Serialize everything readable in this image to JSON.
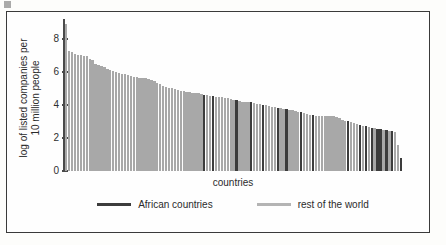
{
  "chart_data": {
    "type": "bar",
    "title": "",
    "xlabel": "countries",
    "ylabel": "log of listed companies per 10 million people",
    "ylabel_lines": [
      "log of listed companies per",
      "10 million people"
    ],
    "ylim": [
      0,
      9.2
    ],
    "yticks": [
      0,
      2,
      4,
      6,
      8
    ],
    "ytick_labels": [
      "0",
      "2",
      "4",
      "6",
      "8"
    ],
    "grid": false,
    "legend_position": "bottom-center",
    "legend": [
      {
        "label": "African countries",
        "color": "#3c3c3c",
        "key": "african"
      },
      {
        "label": "rest of the world",
        "color": "#b4b4b4",
        "key": "rest"
      }
    ],
    "categories_note": "countries sorted in descending order; individual country names are not shown on the axis",
    "series": [
      {
        "name": "log of listed companies per 10 million people",
        "values": [
          8.9,
          7.25,
          7.2,
          7.1,
          7.05,
          7.0,
          6.95,
          6.95,
          6.75,
          6.7,
          6.45,
          6.4,
          6.35,
          6.3,
          6.15,
          6.1,
          6.05,
          6.0,
          5.95,
          5.9,
          5.85,
          5.8,
          5.75,
          5.7,
          5.7,
          5.65,
          5.6,
          5.6,
          5.55,
          5.5,
          5.45,
          5.3,
          5.25,
          5.15,
          5.1,
          5.05,
          5.0,
          4.95,
          4.9,
          4.85,
          4.85,
          4.8,
          4.8,
          4.75,
          4.7,
          4.7,
          4.65,
          4.6,
          4.6,
          4.55,
          4.55,
          4.5,
          4.5,
          4.45,
          4.4,
          4.4,
          4.35,
          4.3,
          4.3,
          4.25,
          4.2,
          4.2,
          4.15,
          4.15,
          4.1,
          4.05,
          4.05,
          4.0,
          4.0,
          3.95,
          3.9,
          3.85,
          3.8,
          3.8,
          3.75,
          3.75,
          3.7,
          3.7,
          3.65,
          3.6,
          3.55,
          3.5,
          3.45,
          3.4,
          3.4,
          3.35,
          3.35,
          3.35,
          3.35,
          3.35,
          3.3,
          3.3,
          3.25,
          3.2,
          3.1,
          3.05,
          3.0,
          2.95,
          2.9,
          2.85,
          2.8,
          2.75,
          2.7,
          2.65,
          2.6,
          2.6,
          2.55,
          2.55,
          2.5,
          2.5,
          2.45,
          2.4,
          2.35,
          1.6,
          0.8
        ],
        "groups": [
          "rest",
          "rest",
          "rest",
          "rest",
          "rest",
          "rest",
          "rest",
          "rest",
          "rest",
          "rest",
          "rest",
          "rest",
          "rest",
          "rest",
          "rest",
          "rest",
          "rest",
          "rest",
          "rest",
          "rest",
          "rest",
          "rest",
          "rest",
          "rest",
          "rest",
          "rest",
          "rest",
          "rest",
          "rest",
          "rest",
          "rest",
          "rest",
          "rest",
          "rest",
          "rest",
          "rest",
          "rest",
          "rest",
          "rest",
          "rest",
          "rest",
          "rest",
          "rest",
          "rest",
          "rest",
          "rest",
          "rest",
          "african",
          "rest",
          "rest",
          "african",
          "rest",
          "rest",
          "rest",
          "rest",
          "rest",
          "rest",
          "rest",
          "african",
          "rest",
          "rest",
          "rest",
          "rest",
          "african",
          "rest",
          "rest",
          "rest",
          "african",
          "rest",
          "rest",
          "rest",
          "rest",
          "african",
          "rest",
          "rest",
          "african",
          "rest",
          "rest",
          "rest",
          "rest",
          "african",
          "rest",
          "rest",
          "rest",
          "african",
          "rest",
          "rest",
          "rest",
          "rest",
          "rest",
          "rest",
          "rest",
          "rest",
          "rest",
          "rest",
          "rest",
          "african",
          "rest",
          "rest",
          "rest",
          "african",
          "rest",
          "african",
          "rest",
          "african",
          "rest",
          "african",
          "african",
          "rest",
          "african",
          "rest",
          "african",
          "rest",
          "rest",
          "african"
        ]
      }
    ]
  }
}
